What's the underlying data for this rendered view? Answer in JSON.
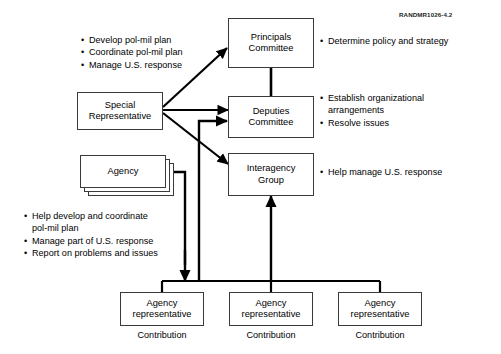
{
  "figure": {
    "id_label": "RANDMR1026-4.2"
  },
  "nodes": {
    "principals": {
      "line1": "Principals",
      "line2": "Committee"
    },
    "deputies": {
      "line1": "Deputies",
      "line2": "Committee"
    },
    "interagency": {
      "line1": "Interagency",
      "line2": "Group"
    },
    "special_rep": {
      "line1": "Special",
      "line2": "Representative"
    },
    "agency": {
      "line1": "Agency"
    },
    "agency_rep_1": {
      "line1": "Agency",
      "line2": "representative"
    },
    "agency_rep_2": {
      "line1": "Agency",
      "line2": "representative"
    },
    "agency_rep_3": {
      "line1": "Agency",
      "line2": "representative"
    }
  },
  "captions": {
    "contribution_1": "Contribution",
    "contribution_2": "Contribution",
    "contribution_3": "Contribution"
  },
  "bullet_groups": {
    "special_rep_duties": {
      "bullet_char": "•",
      "items": [
        "Develop pol-mil plan",
        "Coordinate pol-mil plan",
        "Manage U.S. response"
      ]
    },
    "principals_duties": {
      "bullet_char": "•",
      "items": [
        "Determine policy and strategy"
      ]
    },
    "deputies_duties": {
      "bullet_char": "•",
      "items": [
        "Establish organizational",
        "Resolve issues"
      ],
      "item_0_continuation": "arrangements"
    },
    "interagency_duties": {
      "bullet_char": "•",
      "items": [
        "Help manage U.S. response"
      ]
    },
    "agency_duties": {
      "bullet_char": "•",
      "items": [
        "Help develop and coordinate",
        "Manage part of U.S. response",
        "Report on problems and issues"
      ],
      "item_0_continuation": "pol-mil plan"
    }
  },
  "colors": {
    "stroke": "#3a3a3a",
    "connector": "#000000",
    "background": "#ffffff",
    "text": "#000000"
  }
}
